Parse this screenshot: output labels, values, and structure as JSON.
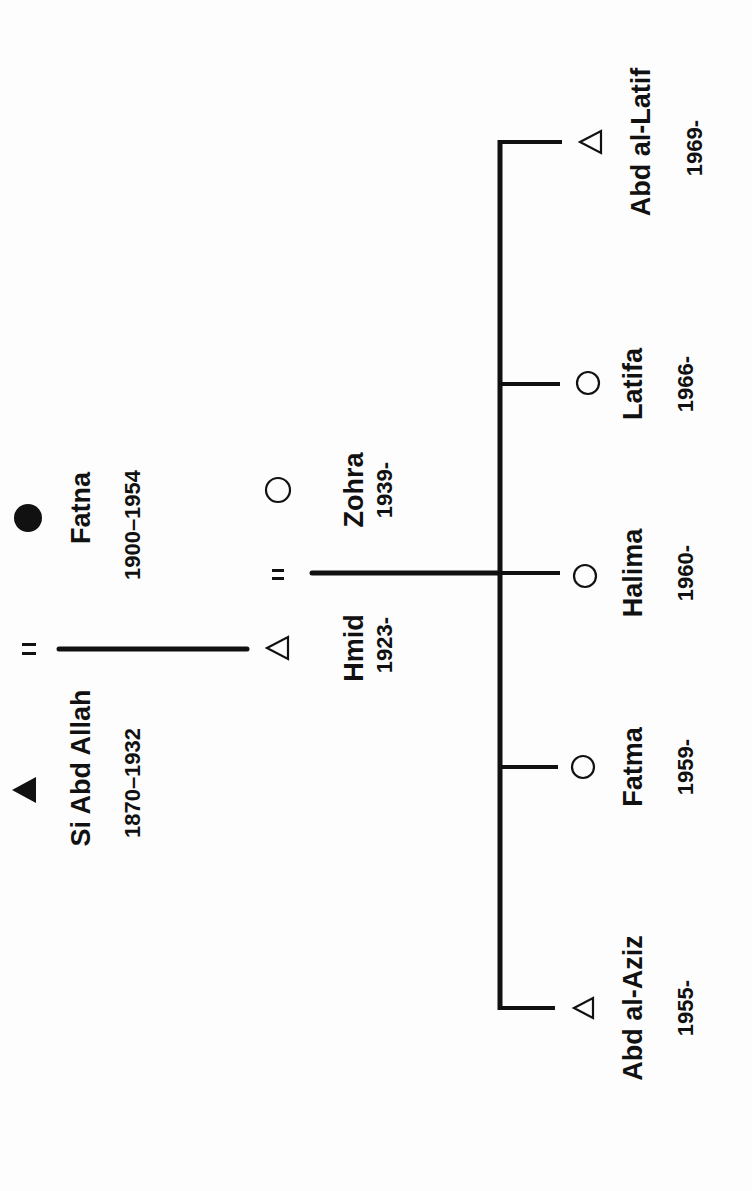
{
  "diagram": {
    "type": "kinship-chart",
    "orientation": "rotated-90-ccw",
    "colors": {
      "ink": "#111111",
      "background": "#fdfdfd"
    },
    "legend_symbols": {
      "filled-triangle": "deceased male",
      "filled-circle": "deceased female",
      "open-triangle": "living male",
      "open-circle": "living female",
      "equals": "marriage"
    },
    "generation1": {
      "husband": {
        "name": "Si Abd Allah",
        "dates": "1870–1932",
        "symbol": "filled-triangle"
      },
      "marriage_sign": "=",
      "wife": {
        "name": "Fatna",
        "dates": "1900–1954",
        "symbol": "filled-circle"
      }
    },
    "generation2": {
      "husband": {
        "name": "Hmid",
        "dates": "1923-",
        "symbol": "open-triangle"
      },
      "marriage_sign": "=",
      "wife": {
        "name": "Zohra",
        "dates": "1939-",
        "symbol": "open-circle"
      }
    },
    "children": [
      {
        "name": "Abd al-Aziz",
        "dates": "1955-",
        "symbol": "open-triangle"
      },
      {
        "name": "Fatma",
        "dates": "1959-",
        "symbol": "open-circle"
      },
      {
        "name": "Halima",
        "dates": "1960-",
        "symbol": "open-circle"
      },
      {
        "name": "Latifa",
        "dates": "1966-",
        "symbol": "open-circle"
      },
      {
        "name": "Abd al-Latif",
        "dates": "1969-",
        "symbol": "open-triangle"
      }
    ]
  }
}
